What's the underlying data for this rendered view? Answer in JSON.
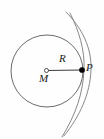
{
  "figure": {
    "background_color": "#fefefe",
    "stroke_color": "#4d4d4d",
    "label_color": "#1a1a1a",
    "point_fill_color": "#000000",
    "labels": {
      "radius": "R",
      "center": "M",
      "point": "P"
    },
    "geometry": {
      "circle": {
        "cx": 47,
        "cy": 71,
        "r": 36
      },
      "center_point": {
        "cx": 46.5,
        "cy": 70.5,
        "r": 2
      },
      "edge_point": {
        "cx": 82,
        "cy": 70,
        "r": 2.6
      },
      "radius_line": {
        "x1": 46.5,
        "y1": 70.5,
        "x2": 82,
        "y2": 70
      },
      "arc_outer": {
        "d": "M 66 12 C 82 28, 92 48, 91 70 C 90 94, 80 116, 64 136"
      },
      "arc_inner": {
        "d": "M 70 13 C 79 31, 85 50, 84 70 C 83 93, 76 114, 62 137"
      }
    }
  }
}
